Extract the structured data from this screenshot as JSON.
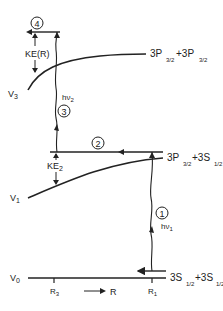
{
  "diagram": {
    "curves": {
      "v0": {
        "label": "V",
        "sub": "0",
        "asymptote": "3S",
        "asym_sub": "1/2",
        "asym2": "+3S",
        "asym2_sub": "1/2"
      },
      "v1": {
        "label": "V",
        "sub": "1",
        "asymptote": "3P",
        "asym_sub": "3/2",
        "asym2": "+3S",
        "asym2_sub": "1/2"
      },
      "v3": {
        "label": "V",
        "sub": "3",
        "asymptote": "3P",
        "asym_sub": "3/2",
        "asym2": "+3P",
        "asym2_sub": "3/2"
      }
    },
    "steps": [
      {
        "num": "1",
        "label": "hν",
        "sub": "1"
      },
      {
        "num": "2"
      },
      {
        "num": "3",
        "label": "hν",
        "sub": "2"
      },
      {
        "num": "4"
      }
    ],
    "energies": {
      "ke_r": "KE(R)",
      "ke2": "KE",
      "ke2_sub": "2"
    },
    "axis": {
      "r3": "R",
      "r3_sub": "3",
      "r1": "R",
      "r1_sub": "1",
      "r_label": "R"
    },
    "colors": {
      "line": "#222222",
      "background": "#ffffff"
    }
  }
}
